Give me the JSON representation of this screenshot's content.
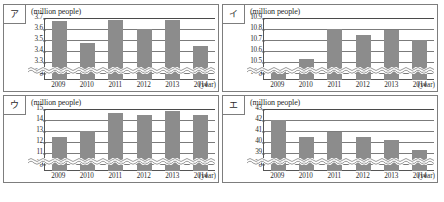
{
  "figure": {
    "unit_label": "(million people)",
    "x_axis_unit": "(year)",
    "zero_tick": "0",
    "bar_color": "#8c8c8c",
    "grid_color": "#7b7b7b",
    "border_color": "#7d7d7d"
  },
  "charts": [
    {
      "key": "a",
      "label": "ア",
      "unit_label": "(million people)",
      "x_axis_unit": "(year)",
      "zero_tick": "0",
      "yticks": [
        "3.7",
        "3.6",
        "3.5",
        "3.4",
        "3.3",
        "3.2"
      ],
      "chart_data": {
        "type": "bar",
        "title": "ア",
        "xlabel": "(year)",
        "ylabel": "(million people)",
        "categories": [
          "2009",
          "2010",
          "2011",
          "2012",
          "2013",
          "2014"
        ],
        "values": [
          3.67,
          3.47,
          3.68,
          3.6,
          3.68,
          3.45
        ],
        "ylim": [
          3.2,
          3.7
        ],
        "axis_break": true,
        "grid": true,
        "legend": "none"
      }
    },
    {
      "key": "b",
      "label": "イ",
      "unit_label": "(million people)",
      "x_axis_unit": "(year)",
      "zero_tick": "0",
      "yticks": [
        "10.9",
        "10.8",
        "10.7",
        "10.6",
        "10.5",
        "10.4"
      ],
      "chart_data": {
        "type": "bar",
        "title": "イ",
        "xlabel": "(year)",
        "ylabel": "(million people)",
        "categories": [
          "2009",
          "2010",
          "2011",
          "2012",
          "2013",
          "2014"
        ],
        "values": [
          10.42,
          10.53,
          10.8,
          10.75,
          10.79,
          10.7
        ],
        "ylim": [
          10.4,
          10.9
        ],
        "axis_break": true,
        "grid": true,
        "legend": "none"
      }
    },
    {
      "key": "c",
      "label": "ウ",
      "unit_label": "(million people)",
      "x_axis_unit": "(year)",
      "zero_tick": "0",
      "yticks": [
        "15",
        "14",
        "13",
        "12",
        "11",
        "10"
      ],
      "chart_data": {
        "type": "bar",
        "title": "ウ",
        "xlabel": "(year)",
        "ylabel": "(million people)",
        "categories": [
          "2009",
          "2010",
          "2011",
          "2012",
          "2013",
          "2014"
        ],
        "values": [
          12.5,
          13.0,
          14.6,
          14.5,
          14.8,
          14.5
        ],
        "ylim": [
          10,
          15
        ],
        "axis_break": true,
        "grid": true,
        "legend": "none"
      }
    },
    {
      "key": "d",
      "label": "エ",
      "unit_label": "(million people)",
      "x_axis_unit": "(year)",
      "zero_tick": "0",
      "yticks": [
        "43",
        "42",
        "41",
        "40",
        "39",
        "38"
      ],
      "chart_data": {
        "type": "bar",
        "title": "エ",
        "xlabel": "(year)",
        "ylabel": "(million people)",
        "categories": [
          "2009",
          "2010",
          "2011",
          "2012",
          "2013",
          "2014"
        ],
        "values": [
          42.0,
          40.5,
          40.9,
          40.5,
          40.2,
          39.3
        ],
        "ylim": [
          38,
          43
        ],
        "axis_break": true,
        "grid": true,
        "legend": "none"
      }
    }
  ],
  "caption": ""
}
